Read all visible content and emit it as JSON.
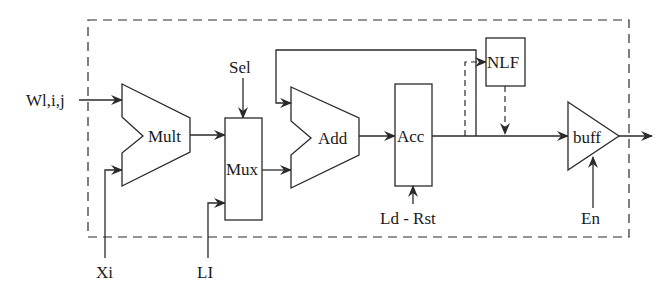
{
  "diagram": {
    "type": "block-diagram",
    "inputs": {
      "weight": "Wl,i,j",
      "x": "Xi",
      "layer": "LI",
      "select": "Sel",
      "load_reset": "Ld - Rst",
      "enable": "En"
    },
    "blocks": {
      "mult": "Mult",
      "mux": "Mux",
      "add": "Add",
      "acc": "Acc",
      "nlf": "NLF",
      "buff": "buff"
    },
    "connections": [
      {
        "from": "Wl,i,j",
        "to": "Mult"
      },
      {
        "from": "Xi",
        "to": "Mult"
      },
      {
        "from": "Mult",
        "to": "Mux"
      },
      {
        "from": "LI",
        "to": "Mux"
      },
      {
        "from": "Sel",
        "to": "Mux"
      },
      {
        "from": "Mux",
        "to": "Add"
      },
      {
        "from": "Add",
        "to": "Acc"
      },
      {
        "from": "Acc",
        "to": "Add",
        "style": "feedback"
      },
      {
        "from": "Ld - Rst",
        "to": "Acc"
      },
      {
        "from": "Acc",
        "to": "NLF",
        "style": "dashed"
      },
      {
        "from": "NLF",
        "to": "buff",
        "style": "dashed"
      },
      {
        "from": "Acc",
        "to": "buff"
      },
      {
        "from": "En",
        "to": "buff"
      },
      {
        "from": "buff",
        "to": "output"
      }
    ],
    "colors": {
      "stroke": "#2a2a2a",
      "background": "#ffffff"
    }
  }
}
